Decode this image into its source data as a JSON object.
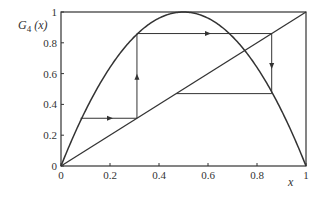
{
  "chart_data": {
    "type": "line",
    "title": "",
    "xlabel": "x",
    "ylabel": "G4 (x)",
    "ylabel_parts": {
      "main": "G",
      "sub": "4",
      "arg": " (x)"
    },
    "xlim": [
      0,
      1
    ],
    "ylim": [
      0,
      1
    ],
    "grid": false,
    "legend": null,
    "x_ticks": [
      "0",
      "0.2",
      "0.4",
      "0.6",
      "0.8",
      "1"
    ],
    "y_ticks": [
      "0",
      "0.2",
      "0.4",
      "0.6",
      "0.8",
      "1"
    ],
    "series": [
      {
        "name": "G4(x) = 4x(1-x)",
        "kind": "curve",
        "function": "4*x*(1-x)"
      },
      {
        "name": "y = x",
        "kind": "line",
        "points": [
          [
            0,
            0
          ],
          [
            1,
            1
          ]
        ]
      },
      {
        "name": "cobweb",
        "kind": "polyline",
        "points": [
          [
            0.08,
            0.31
          ],
          [
            0.31,
            0.31
          ],
          [
            0.31,
            0.86
          ],
          [
            0.86,
            0.86
          ],
          [
            0.86,
            0.47
          ],
          [
            0.47,
            0.47
          ]
        ],
        "arrows": [
          {
            "at": [
              0.2,
              0.31
            ],
            "dir": "right"
          },
          {
            "at": [
              0.31,
              0.58
            ],
            "dir": "up"
          },
          {
            "at": [
              0.6,
              0.86
            ],
            "dir": "right"
          },
          {
            "at": [
              0.86,
              0.65
            ],
            "dir": "down"
          }
        ]
      }
    ]
  },
  "colors": {
    "line": "#333333",
    "background": "#ffffff"
  }
}
